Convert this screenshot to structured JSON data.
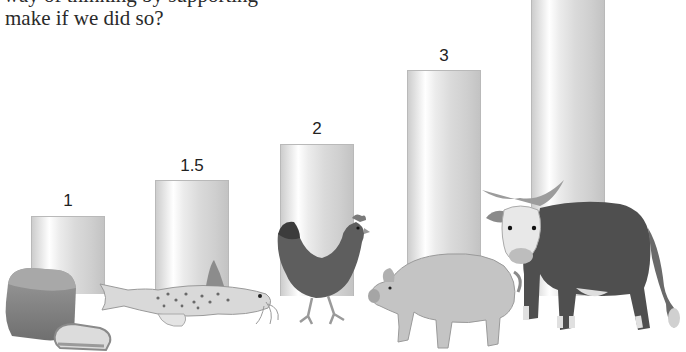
{
  "text": {
    "line1_partial": "your way of thinking by supporting",
    "line2": "make if we did so?"
  },
  "chart_data": {
    "type": "bar",
    "title": "",
    "xlabel": "",
    "ylabel": "",
    "categories": [
      "Bread",
      "Catfish",
      "Chicken",
      "Pig",
      "Cow"
    ],
    "values": [
      1,
      1.5,
      2,
      3,
      null
    ],
    "labels": [
      "1",
      "1.5",
      "2",
      "3",
      ""
    ],
    "grid": false,
    "legend": "none",
    "bar_style": "grey cylindrical gradient"
  },
  "bars": [
    {
      "label": "1",
      "left": 31,
      "top": 216,
      "bottom": 294,
      "label_top": 192
    },
    {
      "label": "1.5",
      "left": 155,
      "top": 180,
      "bottom": 296,
      "label_top": 157
    },
    {
      "label": "2",
      "left": 280,
      "top": 144,
      "bottom": 296,
      "label_top": 120
    },
    {
      "label": "3",
      "left": 407,
      "top": 70,
      "bottom": 296,
      "label_top": 47
    },
    {
      "label": "",
      "left": 531,
      "top": -5,
      "bottom": 296,
      "label_top": -30
    }
  ],
  "icons": {
    "bread": "bread-loaf-illustration",
    "fish": "catfish-illustration",
    "chicken": "chicken-illustration",
    "pig": "pig-illustration",
    "cow": "cow-illustration"
  }
}
